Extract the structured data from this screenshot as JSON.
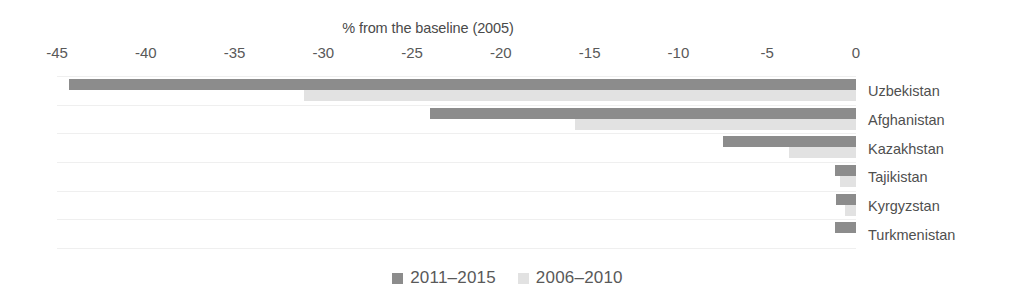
{
  "chart_data": {
    "type": "bar",
    "orientation": "horizontal",
    "title": "% from the baseline (2005)",
    "xlabel": "",
    "ylabel": "",
    "xlim": [
      -45,
      0
    ],
    "xticks": [
      -45,
      -40,
      -35,
      -30,
      -25,
      -20,
      -15,
      -10,
      -5,
      0
    ],
    "xtick_labels": [
      "-45",
      "-40",
      "-35",
      "-30",
      "-25",
      "-20",
      "-15",
      "-10",
      "-5",
      "0"
    ],
    "grid": true,
    "grid_axis": "y",
    "legend_position": "bottom",
    "categories": [
      "Uzbekistan",
      "Afghanistan",
      "Kazakhstan",
      "Tajikistan",
      "Kyrgyzstan",
      "Turkmenistan"
    ],
    "series": [
      {
        "name": "2011–2015",
        "color": "#8c8c8c",
        "values": [
          -44.3,
          -24.0,
          -7.5,
          -1.2,
          -1.1,
          -1.2
        ]
      },
      {
        "name": "2006–2010",
        "color": "#e2e2e2",
        "values": [
          -31.1,
          -15.8,
          -3.8,
          -0.9,
          -0.6,
          0.0
        ]
      }
    ]
  },
  "legend": {
    "items": [
      {
        "label": "2011–2015",
        "swatch": "series-a"
      },
      {
        "label": "2006–2010",
        "swatch": "series-b"
      }
    ]
  },
  "colors": {
    "series_a": "#8c8c8c",
    "series_b": "#e2e2e2",
    "gridline": "#efefef",
    "text": "#595959",
    "background": "#ffffff"
  }
}
